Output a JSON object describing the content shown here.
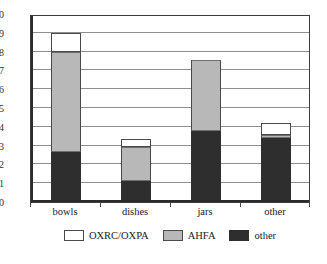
{
  "chart_data": {
    "type": "bar",
    "stacked": true,
    "title": "",
    "xlabel": "",
    "ylabel": "",
    "categories": [
      "bowls",
      "dishes",
      "jars",
      "other"
    ],
    "series": [
      {
        "name": "other",
        "color": "#2e2e2e",
        "values": [
          2.65,
          1.1,
          3.8,
          3.4
        ]
      },
      {
        "name": "AHFA",
        "color": "#b8b8b8",
        "values": [
          5.35,
          1.85,
          3.75,
          0.15
        ]
      },
      {
        "name": "OXRC/OXPA",
        "color": "#ffffff",
        "values": [
          1.0,
          0.38,
          0.0,
          0.65
        ]
      }
    ],
    "totals": [
      9.0,
      3.33,
      7.55,
      4.2
    ],
    "ylim": [
      0,
      10
    ],
    "yticks": [
      0,
      1,
      2,
      3,
      4,
      5,
      6,
      7,
      8,
      9,
      10
    ],
    "ytick_labels": [
      "0",
      "1",
      "2",
      "3",
      "4",
      "5",
      "6",
      "7",
      "8",
      "9",
      "10"
    ],
    "grid": true,
    "legend_position": "bottom",
    "legend": [
      {
        "label": "OXRC/OXPA",
        "color": "#ffffff"
      },
      {
        "label": "AHFA",
        "color": "#b8b8b8"
      },
      {
        "label": "other",
        "color": "#2e2e2e"
      }
    ]
  },
  "colors": {
    "segment_other": "#2e2e2e",
    "segment_ahfa": "#b8b8b8",
    "segment_oxrc": "#ffffff",
    "axis": "#2b2b2b",
    "grid": "#8f8f8f",
    "background": "#ffffff"
  }
}
